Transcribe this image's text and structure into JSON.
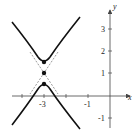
{
  "diagram": {
    "type": "hyperbola-graph",
    "equation_hint": "vertical hyperbola centered at (-3, 1)",
    "center": {
      "x": -3,
      "y": 1
    },
    "vertices": [
      {
        "x": -3,
        "y": 1.5
      },
      {
        "x": -3,
        "y": 0.5
      }
    ],
    "axes": {
      "x_label": "x",
      "y_label": "y",
      "x_ticks": [
        {
          "value": -3,
          "label": "-3"
        },
        {
          "value": -1,
          "label": "-1"
        }
      ],
      "y_ticks": [
        {
          "value": 3,
          "label": "3"
        },
        {
          "value": 2,
          "label": "2"
        },
        {
          "value": 1,
          "label": "1"
        },
        {
          "value": -1,
          "label": "-1"
        }
      ],
      "x_range": [
        -5,
        1
      ],
      "y_range": [
        -1.5,
        3.8
      ]
    },
    "asymptotes": "dashed lines through center",
    "colors": {
      "curve": "#111111",
      "axis": "#444444",
      "asymptote": "#555555"
    }
  }
}
